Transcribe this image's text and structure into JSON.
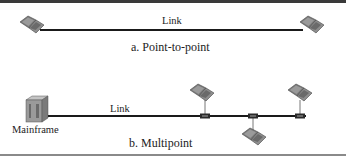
{
  "panel_a": {
    "link_label": "Link",
    "caption": "a. Point-to-point",
    "nodes": [
      {
        "type": "laptop",
        "position": "left"
      },
      {
        "type": "laptop",
        "position": "right"
      }
    ]
  },
  "panel_b": {
    "link_label": "Link",
    "caption": "b. Multipoint",
    "mainframe_label": "Mainframe",
    "nodes": [
      {
        "type": "mainframe",
        "position": "left"
      },
      {
        "type": "laptop",
        "position": "above-tap-1"
      },
      {
        "type": "laptop",
        "position": "below-tap-2"
      },
      {
        "type": "laptop",
        "position": "above-tap-3"
      }
    ],
    "taps": 3
  },
  "colors": {
    "line": "#1a1a1a",
    "laptop_body": "#8e8e8e",
    "laptop_screen": "#6f6f6f",
    "mainframe": "#a8a8a8",
    "top_border": "#3a3a3a",
    "bottom_border": "#8a8a8a"
  }
}
